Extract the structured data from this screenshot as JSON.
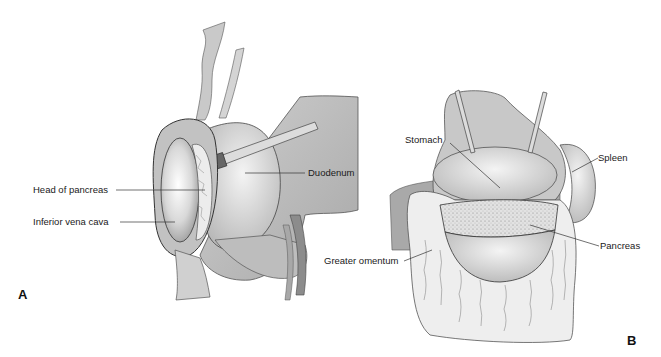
{
  "figure": {
    "panels": [
      {
        "id": "A",
        "label": "A",
        "labels": {
          "head_of_pancreas": "Head of pancreas",
          "inferior_vena_cava": "Inferior vena cava",
          "duodenum": "Duodenum"
        }
      },
      {
        "id": "B",
        "label": "B",
        "labels": {
          "stomach": "Stomach",
          "spleen": "Spleen",
          "pancreas": "Pancreas",
          "greater_omentum": "Greater omentum"
        }
      }
    ],
    "colors": {
      "background": "#ffffff",
      "tissue_light": "#e6e6e6",
      "tissue_mid": "#c4c4c4",
      "tissue_dark": "#9a9a9a",
      "outline": "#333333"
    }
  }
}
